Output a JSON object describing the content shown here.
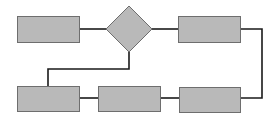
{
  "diagram": {
    "type": "flowchart",
    "colors": {
      "background": "#ffffff",
      "node_fill": "#b9b9b9",
      "node_stroke": "#6e6e6e",
      "edge": "#1a1a1a"
    },
    "nodes": [
      {
        "id": "box-top-left",
        "shape": "rect",
        "x": 17,
        "y": 16,
        "w": 62,
        "h": 26,
        "label": ""
      },
      {
        "id": "decision",
        "shape": "diamond",
        "cx": 129,
        "cy": 29,
        "rx": 23,
        "ry": 23,
        "label": ""
      },
      {
        "id": "box-top-right",
        "shape": "rect",
        "x": 178,
        "y": 16,
        "w": 62,
        "h": 26,
        "label": ""
      },
      {
        "id": "box-bottom-left",
        "shape": "rect",
        "x": 17,
        "y": 86,
        "w": 62,
        "h": 25,
        "label": ""
      },
      {
        "id": "box-bottom-middle",
        "shape": "rect",
        "x": 98,
        "y": 86,
        "w": 62,
        "h": 25,
        "label": ""
      },
      {
        "id": "box-bottom-right",
        "shape": "rect",
        "x": 179,
        "y": 87,
        "w": 61,
        "h": 25,
        "label": ""
      }
    ],
    "edges": [
      {
        "id": "edge-box1-decision",
        "points": "79,29 106,29"
      },
      {
        "id": "edge-decision-box2",
        "points": "152,29 178,29"
      },
      {
        "id": "edge-decision-bottomleft",
        "points": "129,52 129,69 48,69 48,86"
      },
      {
        "id": "edge-box2-bottomright",
        "points": "240,29 262,29 262,98 240,98"
      },
      {
        "id": "edge-bottommiddle-bottomright",
        "points": "160,98 179,98"
      },
      {
        "id": "edge-bottomleft-bottommiddle",
        "points": "79,98 98,98"
      }
    ]
  }
}
